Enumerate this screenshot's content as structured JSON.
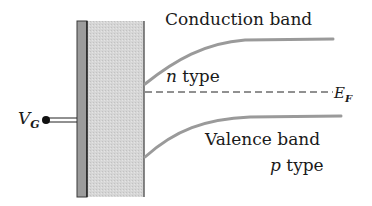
{
  "diagram": {
    "labels": {
      "conduction_band": "Conduction band",
      "n_type_letter": "n",
      "n_type_rest": " type",
      "fermi_main": "E",
      "fermi_sub": "F",
      "valence_band": "Valence band",
      "p_type_letter": "p",
      "p_type_rest": " type",
      "gate_main": "V",
      "gate_sub": "G"
    },
    "colors": {
      "band_curve": "#9a9a9a",
      "oxide_fill": "#d4d4d4",
      "metal_fill": "#9c9c9c",
      "line": "#2a2a2a"
    }
  }
}
